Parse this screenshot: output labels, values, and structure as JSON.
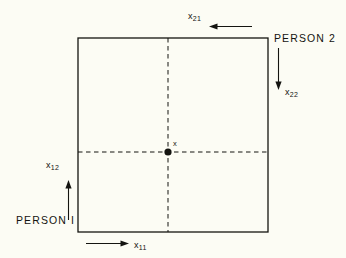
{
  "figure": {
    "type": "edgeworth-box",
    "background_color": "#fcfcf4",
    "ink_color": "#141410",
    "box": {
      "left": 78,
      "top": 38,
      "right": 268,
      "bottom": 232
    },
    "labels": {
      "person_1": "PERSON I",
      "person_2": "PERSON 2",
      "allocation_point": "x"
    },
    "axes": [
      {
        "id": "x11",
        "symbol": "x",
        "subscript": "11",
        "owner": "PERSON I",
        "direction": "right",
        "position": "bottom-left-outside"
      },
      {
        "id": "x12",
        "symbol": "x",
        "subscript": "12",
        "owner": "PERSON I",
        "direction": "up",
        "position": "left-outside"
      },
      {
        "id": "x21",
        "symbol": "x",
        "subscript": "21",
        "owner": "PERSON 2",
        "direction": "left",
        "position": "top-right-outside"
      },
      {
        "id": "x22",
        "symbol": "x",
        "subscript": "22",
        "owner": "PERSON 2",
        "direction": "down",
        "position": "right-outside"
      }
    ],
    "allocation": {
      "dot_x": 168,
      "dot_y": 152,
      "dashed_vertical": true,
      "dashed_horizontal": true
    }
  }
}
